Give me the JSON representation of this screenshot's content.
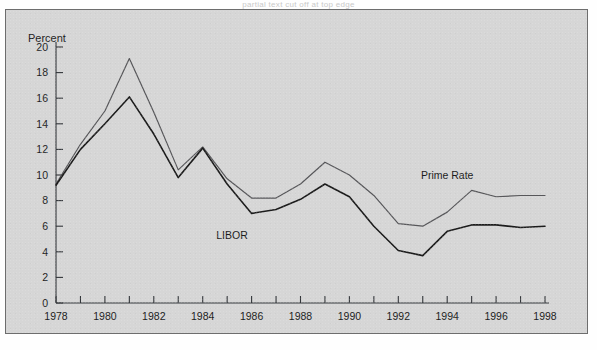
{
  "caption": "partial text cut off at top edge",
  "figure": {
    "background_color": "#d6d6d6",
    "border_color": "#6d6d6d",
    "y_axis_title": "Percent"
  },
  "labels": {
    "prime_rate": "Prime Rate",
    "libor": "LIBOR"
  },
  "chart_data": {
    "type": "line",
    "title": "",
    "subtitle": "",
    "xlabel": "",
    "ylabel": "Percent",
    "xlim": [
      1978,
      1998
    ],
    "ylim": [
      0,
      20
    ],
    "ytick_step": 2,
    "xtick_step": 1,
    "xtick_label_step": 2,
    "grid": false,
    "legend": "inline-annotations",
    "yticks": [
      0,
      2,
      4,
      6,
      8,
      10,
      12,
      14,
      16,
      18,
      20
    ],
    "xticks": [
      1978,
      1979,
      1980,
      1981,
      1982,
      1983,
      1984,
      1985,
      1986,
      1987,
      1988,
      1989,
      1990,
      1991,
      1992,
      1993,
      1994,
      1995,
      1996,
      1997,
      1998
    ],
    "xtick_labels": [
      "1978",
      "1980",
      "1982",
      "1984",
      "1986",
      "1988",
      "1990",
      "1992",
      "1994",
      "1996",
      "1998"
    ],
    "x": [
      1978,
      1979,
      1980,
      1981,
      1982,
      1983,
      1984,
      1985,
      1986,
      1987,
      1988,
      1989,
      1990,
      1991,
      1992,
      1993,
      1994,
      1995,
      1996,
      1997,
      1998
    ],
    "series": [
      {
        "name": "Prime Rate",
        "color": "#57575a",
        "width": 1.2,
        "values": [
          9.3,
          12.4,
          15.0,
          19.1,
          14.9,
          10.4,
          12.2,
          9.7,
          8.2,
          8.2,
          9.3,
          11.0,
          10.0,
          8.4,
          6.2,
          6.0,
          7.1,
          8.8,
          8.3,
          8.4,
          8.4
        ]
      },
      {
        "name": "LIBOR",
        "color": "#1c1c1c",
        "width": 1.6,
        "values": [
          9.2,
          12.0,
          14.0,
          16.1,
          13.2,
          9.8,
          12.1,
          9.3,
          7.0,
          7.3,
          8.1,
          9.3,
          8.3,
          6.0,
          4.1,
          3.7,
          5.6,
          6.1,
          6.1,
          5.9,
          6.0
        ]
      }
    ],
    "annotations": [
      {
        "text": "Prime Rate",
        "x": 1994.0,
        "y": 9.7
      },
      {
        "text": "LIBOR",
        "x": 1985.2,
        "y": 5.0
      }
    ]
  }
}
